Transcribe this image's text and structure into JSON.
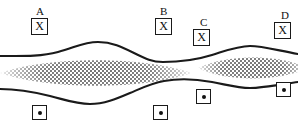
{
  "figure": {
    "width": 298,
    "height": 135,
    "background_color": "#ffffff",
    "line_color": "#1a1a1a",
    "stipple_color": "#4a4a4a"
  },
  "regions": [
    {
      "id": "A",
      "label": "A",
      "label_x": 36,
      "label_y": 6
    },
    {
      "id": "B",
      "label": "B",
      "label_x": 160,
      "label_y": 6
    },
    {
      "id": "C",
      "label": "C",
      "label_x": 200,
      "label_y": 17
    },
    {
      "id": "D",
      "label": "D",
      "label_x": 281,
      "label_y": 10
    }
  ],
  "upper_markers": [
    {
      "id": "A",
      "glyph": "X",
      "x": 31,
      "y": 18
    },
    {
      "id": "B",
      "glyph": "X",
      "x": 155,
      "y": 18
    },
    {
      "id": "C",
      "glyph": "X",
      "x": 193,
      "y": 29
    },
    {
      "id": "D",
      "glyph": "X",
      "x": 274,
      "y": 22
    }
  ],
  "lower_markers": [
    {
      "id": "A",
      "glyph": "dot",
      "x": 32,
      "y": 105
    },
    {
      "id": "B",
      "glyph": "dot",
      "x": 153,
      "y": 105
    },
    {
      "id": "C",
      "glyph": "dot",
      "x": 196,
      "y": 89
    },
    {
      "id": "D",
      "glyph": "dot",
      "x": 276,
      "y": 82
    }
  ],
  "curves": {
    "upper_path": "M 0,56 C 20,56 40,57 58,52 C 76,47 84,42 98,42 C 112,42 122,47 134,53 C 146,59 152,62 163,62 C 178,62 196,60 212,55 C 228,50 238,46 250,46 C 262,46 276,50 298,54",
    "lower_path": "M 0,89 C 18,89 34,92 50,96 C 66,100 76,104 90,104 C 104,104 116,99 130,93 C 144,87 152,83 164,81 C 180,78 196,79 212,82 C 228,85 238,88 250,88 C 262,88 278,85 298,82"
  },
  "stipple_regions": [
    {
      "id": "left-lens",
      "center_x": 96,
      "center_y": 73,
      "half_width": 96,
      "half_height": 17
    },
    {
      "id": "right-lens",
      "center_x": 253,
      "center_y": 68,
      "half_width": 55,
      "half_height": 14
    }
  ]
}
